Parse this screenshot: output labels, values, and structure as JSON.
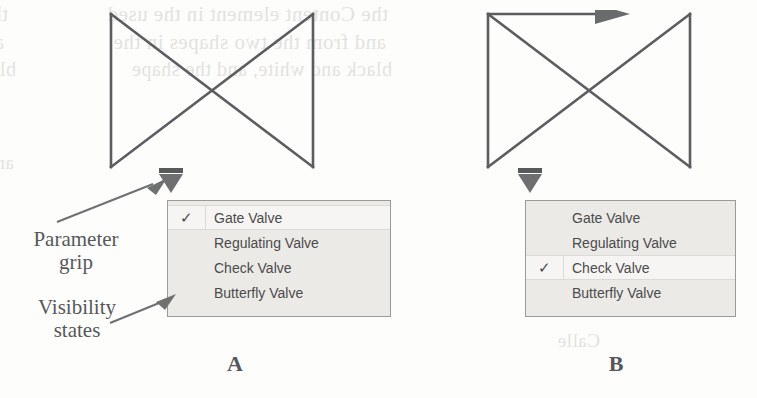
{
  "figure": {
    "background_color": "#fdfdfc",
    "stroke_color": "#5c5d5f",
    "menu_background": "#eceae6",
    "menu_border": "#9a9a98",
    "selected_row_background": "#f6f5f3",
    "text_color": "#4b4b4d",
    "annotation_color": "#57585a"
  },
  "annotations": [
    {
      "name": "parameter-grip",
      "label": "Parameter\ngrip",
      "line1": "Parameter",
      "line2": "grip"
    },
    {
      "name": "visibility-states",
      "label": "Visibility\nstates",
      "line1": "Visibility",
      "line2": "states"
    }
  ],
  "annotation_labels": {
    "parameter_grip_line1": "Parameter",
    "parameter_grip_line2": "grip",
    "visibility_states_line1": "Visibility",
    "visibility_states_line2": "states"
  },
  "panels": [
    {
      "id": "A",
      "caption": "A",
      "symbol": {
        "name": "gate-valve-bowtie",
        "has_flow_arrow": false
      },
      "grip": {
        "name": "parameter-grip",
        "shape": "down-triangle"
      },
      "menu": {
        "name": "visibility-states-menu",
        "selected": "Gate Valve",
        "items": [
          {
            "label": "Gate Valve",
            "checked": true,
            "check_glyph": "✓"
          },
          {
            "label": "Regulating Valve",
            "checked": false,
            "check_glyph": ""
          },
          {
            "label": "Check Valve",
            "checked": false,
            "check_glyph": ""
          },
          {
            "label": "Butterfly Valve",
            "checked": false,
            "check_glyph": ""
          }
        ]
      }
    },
    {
      "id": "B",
      "caption": "B",
      "symbol": {
        "name": "check-valve-bowtie",
        "has_flow_arrow": true
      },
      "grip": {
        "name": "parameter-grip",
        "shape": "down-triangle"
      },
      "menu": {
        "name": "visibility-states-menu",
        "selected": "Check Valve",
        "items": [
          {
            "label": "Gate Valve",
            "checked": false,
            "check_glyph": ""
          },
          {
            "label": "Regulating Valve",
            "checked": false,
            "check_glyph": ""
          },
          {
            "label": "Check Valve",
            "checked": true,
            "check_glyph": "✓"
          },
          {
            "label": "Butterfly Valve",
            "checked": false,
            "check_glyph": ""
          }
        ]
      }
    }
  ],
  "background_ghost_text": {
    "line_a": "the Content element in the sheet",
    "line_b": "and from the two shapes in the",
    "line_c": "black and white, and the shape",
    "line_d": "the Content element in the used",
    "line_e": "and from the two shapes in the",
    "line_f": "black and white, and the shape",
    "line_g": "Calle",
    "line_h": "and"
  }
}
